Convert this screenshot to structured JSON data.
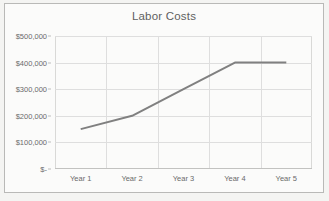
{
  "chart_data": {
    "type": "line",
    "title": "Labor Costs",
    "xlabel": "",
    "ylabel": "",
    "categories": [
      "Year 1",
      "Year 2",
      "Year 3",
      "Year 4",
      "Year 5"
    ],
    "values": [
      150000,
      200000,
      300000,
      400000,
      400000
    ],
    "series": [
      {
        "name": "Labor Costs",
        "values": [
          150000,
          200000,
          300000,
          400000,
          400000
        ]
      }
    ],
    "ylim": [
      0,
      500000
    ],
    "ytick_values": [
      0,
      100000,
      200000,
      300000,
      400000,
      500000
    ],
    "ytick_labels": [
      "$-",
      "$100,000",
      "$200,000",
      "$300,000",
      "$400,000",
      "$500,000"
    ],
    "grid": true,
    "grid_axis": "both",
    "legend": false,
    "legend_position": "none",
    "line_color": "#808080",
    "grid_color": "#dedede",
    "plot_border_color": "#d9d9d7",
    "title_color": "#5f5f5f",
    "tick_label_color": "#6a6a6a",
    "background_color": "#fbfbfa",
    "frame_color": "#b9b9b7"
  }
}
